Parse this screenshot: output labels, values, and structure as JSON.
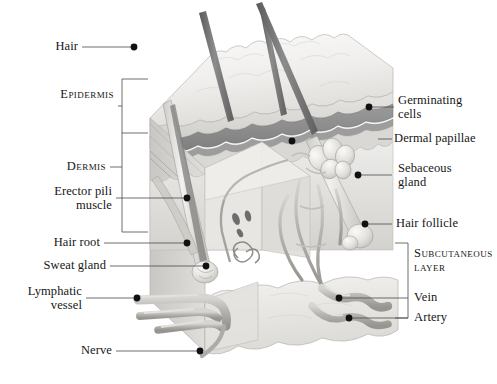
{
  "figure": {
    "kind": "anatomical-illustration",
    "palette": {
      "ink": "#161616",
      "leader": "#4a4a4a",
      "epidermis_light": "#f0efed",
      "epidermis_shade": "#d9d7d4",
      "germinating_band": "#8f8f8f",
      "dermis_fill": "#e6e5e2",
      "dermis_shade": "#cfcdc9",
      "subcutaneous": "#eeedea",
      "vessel": "#b9b8b4",
      "hair_dark": "#6e6e6e",
      "background": "#ffffff"
    }
  },
  "labels": {
    "hair": "Hair",
    "epidermis": "Epidermis",
    "dermis": "Dermis",
    "erector_pili_line1": "Erector pili",
    "erector_pili_line2": "muscle",
    "hair_root": "Hair root",
    "sweat_gland": "Sweat gland",
    "lymphatic_line1": "Lymphatic",
    "lymphatic_line2": "vessel",
    "nerve": "Nerve",
    "germinating_line1": "Germinating",
    "germinating_line2": "cells",
    "dermal_papillae": "Dermal papillae",
    "sebaceous_line1": "Sebaceous",
    "sebaceous_line2": "gland",
    "hair_follicle": "Hair follicle",
    "subcutaneous_line1": "Subcutaneous",
    "subcutaneous_line2": "layer",
    "vein": "Vein",
    "artery": "Artery"
  }
}
